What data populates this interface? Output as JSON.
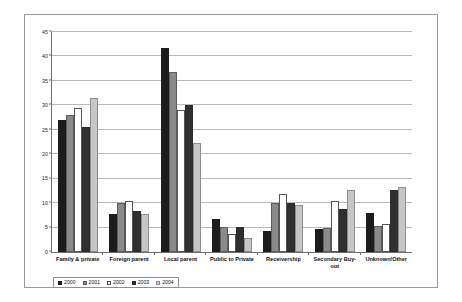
{
  "chart_data": {
    "type": "bar",
    "title": "",
    "subtitle": "",
    "xlabel": "",
    "ylabel": "",
    "ylim": [
      0,
      45
    ],
    "ytick_step": 5,
    "yticks": [
      0,
      5,
      10,
      15,
      20,
      25,
      30,
      35,
      40,
      45
    ],
    "grid": true,
    "legend_position": "bottom-left",
    "categories": [
      "Family & private",
      "Foreign parent",
      "Local parent",
      "Public to Private",
      "Receivership",
      "Secondary Buy-out",
      "Unknown/Other"
    ],
    "series": [
      {
        "name": "2000",
        "color": "#1c1c1c",
        "values": [
          27.0,
          7.8,
          41.8,
          6.8,
          4.3,
          4.7,
          7.9
        ]
      },
      {
        "name": "2001",
        "color": "#8a8a8a",
        "values": [
          28.0,
          10.0,
          36.8,
          5.2,
          10.0,
          4.9,
          5.4
        ]
      },
      {
        "name": "2002",
        "color": "#ffffff",
        "values": [
          29.4,
          10.4,
          29.1,
          3.6,
          11.9,
          10.4,
          5.7
        ]
      },
      {
        "name": "2003",
        "color": "#303030",
        "values": [
          25.6,
          8.3,
          30.0,
          5.1,
          10.0,
          8.7,
          12.6
        ]
      },
      {
        "name": "2004",
        "color": "#c6c6c6",
        "values": [
          31.6,
          7.7,
          22.3,
          2.8,
          9.6,
          12.7,
          13.4
        ]
      }
    ]
  }
}
